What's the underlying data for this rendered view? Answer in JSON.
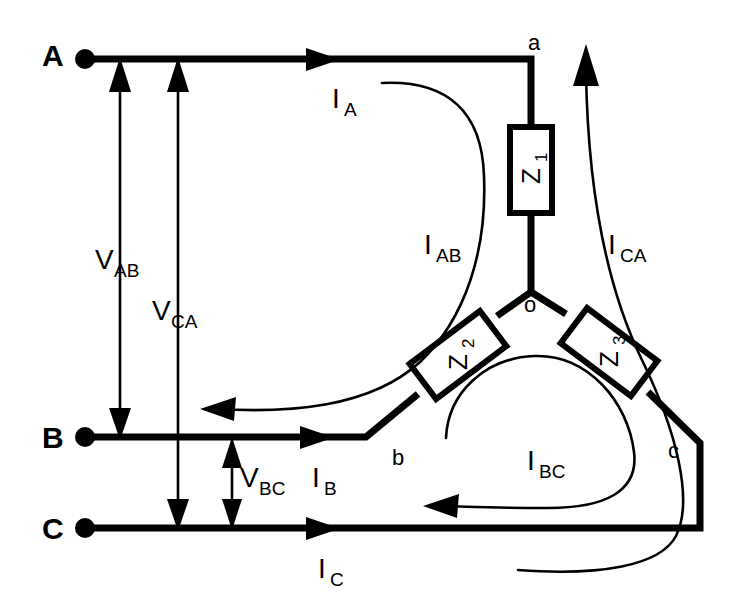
{
  "figure": {
    "type": "electrical-circuit-diagram",
    "background_color": "#ffffff",
    "line_color": "#000000",
    "width": 751,
    "height": 608
  },
  "terminals": [
    {
      "id": "A",
      "label": "A",
      "x": 42,
      "y": 66,
      "dot_x": 85,
      "dot_y": 59
    },
    {
      "id": "B",
      "label": "B",
      "x": 42,
      "y": 448,
      "dot_x": 85,
      "dot_y": 437
    },
    {
      "id": "C",
      "label": "C",
      "x": 42,
      "y": 539,
      "dot_x": 85,
      "dot_y": 528
    }
  ],
  "load_nodes": [
    {
      "id": "a",
      "label": "a",
      "x": 528,
      "y": 50
    },
    {
      "id": "b",
      "label": "b",
      "x": 392,
      "y": 465
    },
    {
      "id": "c",
      "label": "c",
      "x": 668,
      "y": 458
    },
    {
      "id": "o",
      "label": "o",
      "x": 524,
      "y": 312
    }
  ],
  "impedances": [
    {
      "id": "Z1",
      "base": "Z",
      "subscript": "1",
      "orientation": "vertical",
      "cx": 531,
      "cy": 170
    },
    {
      "id": "Z2",
      "base": "Z",
      "subscript": "2",
      "orientation": "diagonal-down-left",
      "cx": 458,
      "cy": 355
    },
    {
      "id": "Z3",
      "base": "Z",
      "subscript": "3",
      "orientation": "diagonal-down-right",
      "cx": 609,
      "cy": 352
    }
  ],
  "line_currents": [
    {
      "id": "IA",
      "base": "I",
      "subscript": "A",
      "label_x": 332,
      "label_y": 108,
      "direction": "right"
    },
    {
      "id": "IB",
      "base": "I",
      "subscript": "B",
      "label_x": 312,
      "label_y": 487,
      "direction": "right"
    },
    {
      "id": "IC",
      "base": "I",
      "subscript": "C",
      "label_x": 318,
      "label_y": 578,
      "direction": "right"
    }
  ],
  "phase_currents": [
    {
      "id": "IAB",
      "base": "I",
      "subscript": "AB",
      "label_x": 424,
      "label_y": 254,
      "direction": "a-to-b"
    },
    {
      "id": "IBC",
      "base": "I",
      "subscript": "BC",
      "label_x": 527,
      "label_y": 470,
      "direction": "c-to-b"
    },
    {
      "id": "ICA",
      "base": "I",
      "subscript": "CA",
      "label_x": 608,
      "label_y": 254,
      "direction": "c-to-a"
    }
  ],
  "voltages": [
    {
      "id": "VAB",
      "base": "V",
      "subscript": "AB",
      "label_x": 95,
      "label_y": 269,
      "arrow": "single-up",
      "from_line": "B",
      "to_line": "A",
      "x": 120
    },
    {
      "id": "VCA",
      "base": "V",
      "subscript": "CA",
      "label_x": 152,
      "label_y": 320,
      "arrow": "single-up",
      "from_line": "C",
      "to_line": "A",
      "x": 178
    },
    {
      "id": "VBC",
      "base": "V",
      "subscript": "BC",
      "label_x": 240,
      "label_y": 487,
      "arrow": "double",
      "from_line": "C",
      "to_line": "B",
      "x": 232
    }
  ]
}
